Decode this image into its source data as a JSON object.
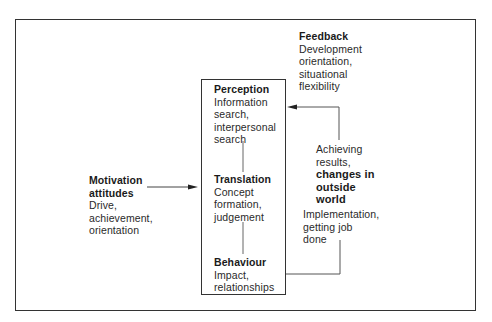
{
  "diagram": {
    "central_box": {
      "perception": {
        "title": "Perception",
        "lines": [
          "Information",
          "search,",
          "interpersonal",
          "search"
        ]
      },
      "translation": {
        "title": "Translation",
        "lines": [
          "Concept",
          "formation,",
          "judgement"
        ]
      },
      "behaviour": {
        "title": "Behaviour",
        "lines": [
          "Impact,",
          "relationships"
        ]
      }
    },
    "motivation": {
      "title_line1": "Motivation",
      "title_line2": "attitudes",
      "lines": [
        "Drive,",
        "achievement,",
        "orientation"
      ]
    },
    "feedback": {
      "title": "Feedback",
      "lines": [
        "Development",
        "orientation,",
        "situational",
        "flexibility"
      ]
    },
    "achieving": {
      "lines": [
        "Achieving",
        "results,"
      ],
      "bold_lines": [
        "changes in",
        "outside",
        "world"
      ]
    },
    "implementation": {
      "lines": [
        "Implementation,",
        "getting job",
        "done"
      ]
    },
    "colors": {
      "line": "#333333",
      "text": "#2a2a2a",
      "background": "#ffffff"
    }
  }
}
